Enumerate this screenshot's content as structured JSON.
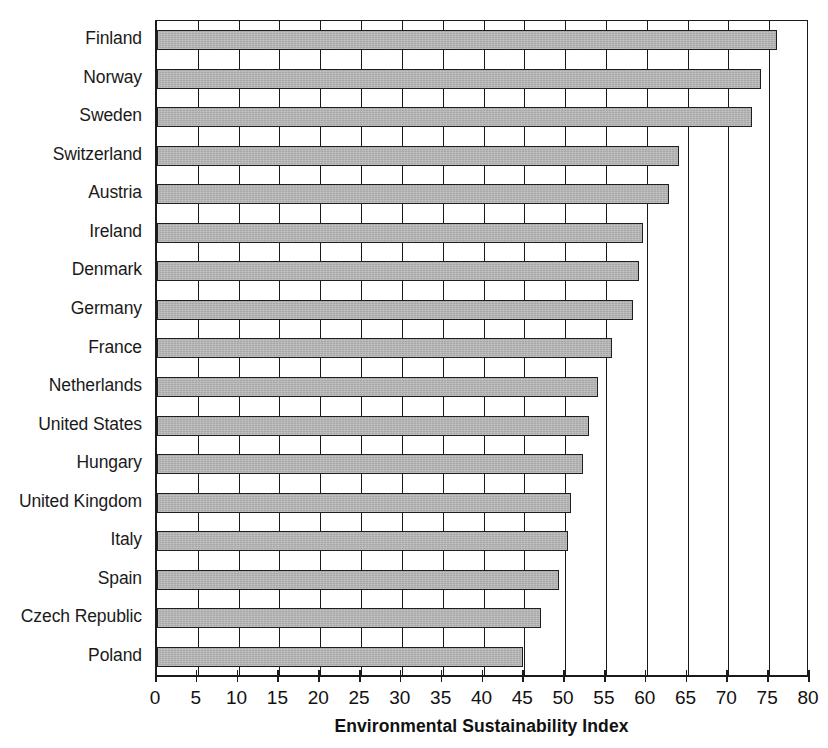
{
  "chart_data": {
    "type": "bar",
    "orientation": "horizontal",
    "title": "",
    "xlabel": "Environmental Sustainability Index",
    "ylabel": "",
    "xlim": [
      0,
      80
    ],
    "xticks": [
      0,
      5,
      10,
      15,
      20,
      25,
      30,
      35,
      40,
      45,
      50,
      55,
      60,
      65,
      70,
      75,
      80
    ],
    "grid": "vertical",
    "legend": "none",
    "bar_color": "#a8a8a8",
    "bar_edge_color": "#1f1f1f",
    "categories": [
      "Finland",
      "Norway",
      "Sweden",
      "Switzerland",
      "Austria",
      "Ireland",
      "Denmark",
      "Germany",
      "France",
      "Netherlands",
      "United States",
      "Hungary",
      "United Kingdom",
      "Italy",
      "Spain",
      "Czech Republic",
      "Poland"
    ],
    "values": [
      76.0,
      74.0,
      72.9,
      64.0,
      62.7,
      59.5,
      59.0,
      58.3,
      55.8,
      54.0,
      52.9,
      52.2,
      50.7,
      50.4,
      49.2,
      47.1,
      44.8
    ]
  },
  "axis": {
    "x_title": "Environmental Sustainability Index",
    "tick_labels": [
      "0",
      "5",
      "10",
      "15",
      "20",
      "25",
      "30",
      "35",
      "40",
      "45",
      "50",
      "55",
      "60",
      "65",
      "70",
      "75",
      "80"
    ]
  }
}
